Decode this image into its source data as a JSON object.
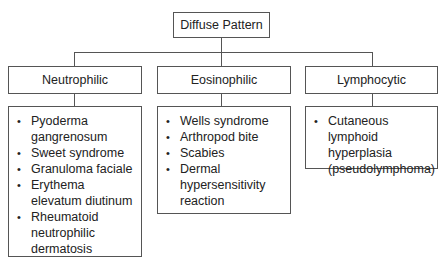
{
  "root": {
    "label": "Diffuse Pattern"
  },
  "categories": [
    {
      "label": "Neutrophilic",
      "items": [
        "Pyoderma gangrenosum",
        "Sweet syndrome",
        "Granuloma faciale",
        "Erythema elevatum diutinum",
        "Rheumatoid neutrophilic dermatosis"
      ]
    },
    {
      "label": "Eosinophilic",
      "items": [
        "Wells syndrome",
        "Arthropod bite",
        "Scabies",
        "Dermal hypersensitivity reaction"
      ]
    },
    {
      "label": "Lymphocytic",
      "items": [
        "Cutaneous lymphoid hyperplasia (pseudolymphoma)"
      ]
    }
  ]
}
